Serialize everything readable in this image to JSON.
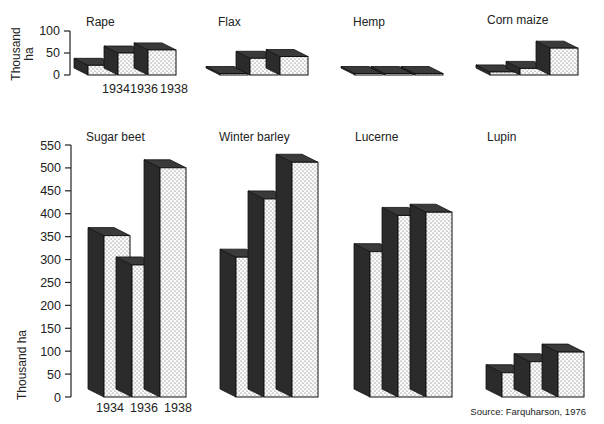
{
  "chart_data": [
    {
      "type": "bar",
      "style": "3d-stepped",
      "title": "Rape",
      "categories": [
        "1934",
        "1936",
        "1938"
      ],
      "values": [
        22,
        50,
        57
      ],
      "ylabel": "Thousand ha",
      "ylim": [
        0,
        100
      ],
      "yticks": [
        0,
        50,
        100
      ],
      "grid": false
    },
    {
      "type": "bar",
      "style": "3d-stepped",
      "title": "Flax",
      "categories": [
        "1934",
        "1936",
        "1938"
      ],
      "values": [
        2,
        38,
        42
      ],
      "ylabel": "Thousand ha",
      "ylim": [
        0,
        100
      ],
      "grid": false
    },
    {
      "type": "bar",
      "style": "3d-stepped",
      "title": "Hemp",
      "categories": [
        "1934",
        "1936",
        "1938"
      ],
      "values": [
        1,
        1,
        3
      ],
      "ylabel": "Thousand ha",
      "ylim": [
        0,
        100
      ],
      "grid": false
    },
    {
      "type": "bar",
      "style": "3d-stepped",
      "title": "Corn maize",
      "categories": [
        "1934",
        "1936",
        "1938"
      ],
      "values": [
        7,
        15,
        61
      ],
      "ylabel": "Thousand ha",
      "ylim": [
        0,
        100
      ],
      "grid": false
    },
    {
      "type": "bar",
      "style": "3d-stepped",
      "title": "Sugar beet",
      "categories": [
        "1934",
        "1936",
        "1938"
      ],
      "values": [
        352,
        288,
        500
      ],
      "ylabel": "Thousand ha",
      "ylim": [
        0,
        550
      ],
      "yticks": [
        0,
        50,
        100,
        150,
        200,
        250,
        300,
        350,
        400,
        450,
        500,
        550
      ],
      "grid": false
    },
    {
      "type": "bar",
      "style": "3d-stepped",
      "title": "Winter barley",
      "categories": [
        "1934",
        "1936",
        "1938"
      ],
      "values": [
        305,
        432,
        512
      ],
      "ylabel": "Thousand ha",
      "ylim": [
        0,
        550
      ],
      "grid": false
    },
    {
      "type": "bar",
      "style": "3d-stepped",
      "title": "Lucerne",
      "categories": [
        "1934",
        "1936",
        "1938"
      ],
      "values": [
        317,
        396,
        403
      ],
      "ylabel": "Thousand ha",
      "ylim": [
        0,
        550
      ],
      "grid": false
    },
    {
      "type": "bar",
      "style": "3d-stepped",
      "title": "Lupin",
      "categories": [
        "1934",
        "1936",
        "1938"
      ],
      "values": [
        53,
        77,
        98
      ],
      "ylabel": "Thousand ha",
      "ylim": [
        0,
        550
      ],
      "grid": false
    }
  ],
  "axes": {
    "top": {
      "ylabel_line1": "Thousand",
      "ylabel_line2": "ha",
      "ticks": [
        "100",
        "50",
        "0"
      ],
      "xticks": [
        "1934",
        "1936",
        "1938"
      ]
    },
    "bottom": {
      "ylabel": "Thousand ha",
      "ticks": [
        "550",
        "500",
        "450",
        "400",
        "350",
        "300",
        "250",
        "200",
        "150",
        "100",
        "50",
        "0"
      ],
      "xticks": [
        "1934",
        "1936",
        "1938"
      ]
    }
  },
  "source": "Source: Farquharson, 1976",
  "colors": {
    "side": "#2b2b2b",
    "top": "#3a3a3a",
    "front": "#fbfbfb",
    "dot": "#555555",
    "stroke": "#111111"
  }
}
